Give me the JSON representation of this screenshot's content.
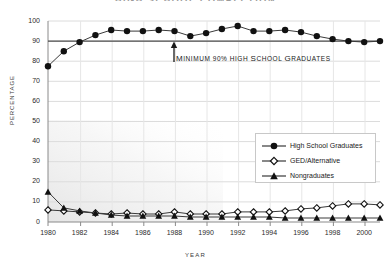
{
  "title": "HIGH SCHOOL COMPLETION",
  "axes": {
    "ylabel": "PERCENTAGE",
    "xlabel": "YEAR",
    "yticks": [
      "0",
      "10",
      "20",
      "30",
      "40",
      "50",
      "60",
      "70",
      "80",
      "90",
      "100"
    ],
    "xticks": [
      "1980",
      "1982",
      "1984",
      "1986",
      "1988",
      "1990",
      "1992",
      "1994",
      "1996",
      "1998",
      "2000"
    ]
  },
  "annotation": {
    "first": "M",
    "rest": "INIMUM 90% H",
    "full": "MINIMUM 90% HIGH SCHOOL GRADUATES",
    "parts": [
      "M",
      "INIMUM ",
      "90% H",
      "IGH ",
      "S",
      "CHOOL ",
      "G",
      "RADUATES"
    ]
  },
  "legend": {
    "items": [
      {
        "label": "High School Graduates",
        "marker": "filled-circle",
        "color": "#1a1a1a"
      },
      {
        "label": "GED/Alternative",
        "marker": "open-diamond",
        "color": "#1a1a1a"
      },
      {
        "label": "Nongraduates",
        "marker": "filled-triangle",
        "color": "#1a1a1a"
      }
    ]
  },
  "colors": {
    "line": "#3a3a3a",
    "marker": "#111111",
    "grid": "#d9d9d9",
    "axis": "#7a7a7a",
    "reference_line": "#555555",
    "shade": "#eeeeee"
  },
  "chart_data": {
    "type": "line",
    "title": "HIGH SCHOOL COMPLETION",
    "xlabel": "YEAR",
    "ylabel": "PERCENTAGE",
    "ylim": [
      0,
      100
    ],
    "xlim": [
      1980,
      2001
    ],
    "grid": true,
    "legend_position": "center-right",
    "reference_line": {
      "value": 90,
      "label": "MINIMUM 90% HIGH SCHOOL GRADUATES"
    },
    "x": [
      1980,
      1981,
      1982,
      1983,
      1984,
      1985,
      1986,
      1987,
      1988,
      1989,
      1990,
      1991,
      1992,
      1993,
      1994,
      1995,
      1996,
      1997,
      1998,
      1999,
      2000,
      2001
    ],
    "series": [
      {
        "name": "High School Graduates",
        "marker": "filled-circle",
        "values": [
          77.5,
          85,
          89.5,
          93,
          95.5,
          95,
          95,
          95.5,
          95,
          92.5,
          94,
          96,
          97.5,
          95,
          95,
          95.5,
          94.5,
          92.5,
          91,
          90,
          89.5,
          90
        ]
      },
      {
        "name": "GED/Alternative",
        "marker": "open-diamond",
        "values": [
          6,
          5.5,
          5,
          4.5,
          4,
          4.5,
          4,
          4,
          5,
          4,
          4,
          4,
          5,
          5,
          5,
          5.5,
          6.5,
          7,
          8,
          9,
          9,
          8.5
        ]
      },
      {
        "name": "Nongraduates",
        "marker": "filled-triangle",
        "values": [
          15,
          7,
          5.5,
          4.5,
          3.5,
          3,
          3,
          3,
          3,
          2.5,
          2.5,
          2.5,
          2.5,
          2.5,
          2.5,
          2,
          2,
          2,
          2,
          2,
          2,
          2
        ]
      }
    ]
  }
}
